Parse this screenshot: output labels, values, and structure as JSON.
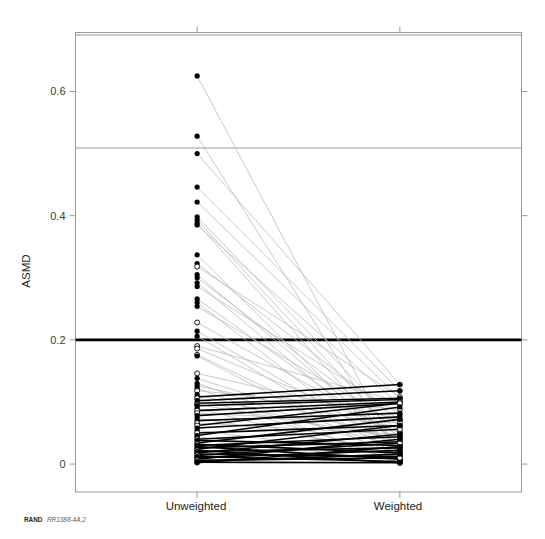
{
  "figure": {
    "width": 545,
    "height": 539,
    "background": "#ffffff",
    "credit_org": "RAND",
    "credit_id": "RR1388-4A.2"
  },
  "colors": {
    "frame": "#9a9a9a",
    "reference_light": "#9a9a9a",
    "reference_bold": "#000000",
    "link_gray": "#b8b8b8",
    "link_black": "#000000",
    "marker_fill": "#000000",
    "marker_open": "#ffffff",
    "text": "#231f20"
  },
  "chart_data": {
    "type": "line",
    "title": "",
    "subtitle": "",
    "xlabel": "",
    "ylabel": "ASMD",
    "categories": [
      "Unweighted",
      "Weighted"
    ],
    "x": [
      0,
      1
    ],
    "xlim": [
      -0.6,
      1.6
    ],
    "ylim": [
      -0.045,
      0.695
    ],
    "ytick_values": [
      0,
      0.2,
      0.4,
      0.6
    ],
    "ytick_labels": [
      "0",
      "0.2",
      "0.4",
      "0.6"
    ],
    "grid": false,
    "legend_position": "none",
    "annotations": [
      {
        "text": "RAND RR1388-4A.2",
        "position": "bottom-left",
        "kind": "source-credit"
      }
    ],
    "reference_lines": [
      {
        "y": 0.691,
        "style": "thin-gray",
        "note": "upper frame inner rule"
      },
      {
        "y": 0.509,
        "style": "thin-gray",
        "note": "mid rule"
      },
      {
        "y": 0.2,
        "style": "thick-black",
        "note": "ASMD balance threshold 0.2"
      }
    ],
    "marker_styles": {
      "filled": "solid black dot",
      "open": "hollow circle"
    },
    "series_note": "Each series is one covariate: ASMD before weighting (Unweighted) vs after weighting (Weighted). Thick black links denote pairs where ASMD changed little or increased; light gray links denote large reductions.",
    "series": [
      {
        "name": "cov-01",
        "values": [
          0.625,
          0.012
        ],
        "marker": "filled",
        "link": "gray"
      },
      {
        "name": "cov-02",
        "values": [
          0.528,
          0.01
        ],
        "marker": "filled",
        "link": "gray"
      },
      {
        "name": "cov-03",
        "values": [
          0.5,
          0.128
        ],
        "marker": "filled",
        "link": "gray"
      },
      {
        "name": "cov-04",
        "values": [
          0.446,
          0.118
        ],
        "marker": "filled",
        "link": "gray"
      },
      {
        "name": "cov-05",
        "values": [
          0.422,
          0.106
        ],
        "marker": "filled",
        "link": "gray"
      },
      {
        "name": "cov-06",
        "values": [
          0.398,
          0.06
        ],
        "marker": "filled",
        "link": "gray"
      },
      {
        "name": "cov-07",
        "values": [
          0.393,
          0.04
        ],
        "marker": "filled",
        "link": "gray"
      },
      {
        "name": "cov-08",
        "values": [
          0.388,
          0.022
        ],
        "marker": "filled",
        "link": "gray"
      },
      {
        "name": "cov-09",
        "values": [
          0.385,
          0.095
        ],
        "marker": "filled",
        "link": "gray"
      },
      {
        "name": "cov-10",
        "values": [
          0.337,
          0.015
        ],
        "marker": "filled",
        "link": "gray"
      },
      {
        "name": "cov-11",
        "values": [
          0.323,
          0.07
        ],
        "marker": "filled",
        "link": "gray"
      },
      {
        "name": "cov-12",
        "values": [
          0.318,
          0.108
        ],
        "marker": "open",
        "link": "gray"
      },
      {
        "name": "cov-13",
        "values": [
          0.305,
          0.03
        ],
        "marker": "filled",
        "link": "gray"
      },
      {
        "name": "cov-14",
        "values": [
          0.3,
          0.052
        ],
        "marker": "filled",
        "link": "gray"
      },
      {
        "name": "cov-15",
        "values": [
          0.292,
          0.018
        ],
        "marker": "filled",
        "link": "gray"
      },
      {
        "name": "cov-16",
        "values": [
          0.286,
          0.08
        ],
        "marker": "filled",
        "link": "gray"
      },
      {
        "name": "cov-17",
        "values": [
          0.266,
          0.035
        ],
        "marker": "filled",
        "link": "gray"
      },
      {
        "name": "cov-18",
        "values": [
          0.26,
          0.008
        ],
        "marker": "filled",
        "link": "gray"
      },
      {
        "name": "cov-19",
        "values": [
          0.254,
          0.062
        ],
        "marker": "filled",
        "link": "gray"
      },
      {
        "name": "cov-20",
        "values": [
          0.228,
          0.045
        ],
        "marker": "open",
        "link": "gray"
      },
      {
        "name": "cov-21",
        "values": [
          0.214,
          0.025
        ],
        "marker": "filled",
        "link": "gray"
      },
      {
        "name": "cov-22",
        "values": [
          0.206,
          0.012
        ],
        "marker": "filled",
        "link": "gray"
      },
      {
        "name": "cov-23",
        "values": [
          0.19,
          0.1
        ],
        "marker": "open",
        "link": "gray"
      },
      {
        "name": "cov-24",
        "values": [
          0.186,
          0.05
        ],
        "marker": "open",
        "link": "gray"
      },
      {
        "name": "cov-25",
        "values": [
          0.176,
          0.02
        ],
        "marker": "open",
        "link": "gray"
      },
      {
        "name": "cov-26",
        "values": [
          0.174,
          0.005
        ],
        "marker": "filled",
        "link": "gray"
      },
      {
        "name": "cov-27",
        "values": [
          0.146,
          0.072
        ],
        "marker": "open",
        "link": "gray"
      },
      {
        "name": "cov-28",
        "values": [
          0.138,
          0.034
        ],
        "marker": "filled",
        "link": "gray"
      },
      {
        "name": "cov-29",
        "values": [
          0.13,
          0.016
        ],
        "marker": "filled",
        "link": "gray"
      },
      {
        "name": "cov-30",
        "values": [
          0.126,
          0.058
        ],
        "marker": "filled",
        "link": "gray"
      },
      {
        "name": "cov-31",
        "values": [
          0.122,
          0.002
        ],
        "marker": "filled",
        "link": "gray"
      },
      {
        "name": "cov-32",
        "values": [
          0.118,
          0.088
        ],
        "marker": "open",
        "link": "gray"
      },
      {
        "name": "cov-33",
        "values": [
          0.112,
          0.028
        ],
        "marker": "filled",
        "link": "gray"
      },
      {
        "name": "cov-34",
        "values": [
          0.108,
          0.128
        ],
        "marker": "filled",
        "link": "black"
      },
      {
        "name": "cov-35",
        "values": [
          0.106,
          0.01
        ],
        "marker": "open",
        "link": "gray"
      },
      {
        "name": "cov-36",
        "values": [
          0.102,
          0.118
        ],
        "marker": "filled",
        "link": "black"
      },
      {
        "name": "cov-37",
        "values": [
          0.098,
          0.106
        ],
        "marker": "filled",
        "link": "black"
      },
      {
        "name": "cov-38",
        "values": [
          0.096,
          0.042
        ],
        "marker": "open",
        "link": "gray"
      },
      {
        "name": "cov-39",
        "values": [
          0.094,
          0.104
        ],
        "marker": "filled",
        "link": "black"
      },
      {
        "name": "cov-40",
        "values": [
          0.09,
          0.006
        ],
        "marker": "filled",
        "link": "gray"
      },
      {
        "name": "cov-41",
        "values": [
          0.086,
          0.1
        ],
        "marker": "open",
        "link": "black"
      },
      {
        "name": "cov-42",
        "values": [
          0.082,
          0.066
        ],
        "marker": "open",
        "link": "gray"
      },
      {
        "name": "cov-43",
        "values": [
          0.078,
          0.098
        ],
        "marker": "filled",
        "link": "black"
      },
      {
        "name": "cov-44",
        "values": [
          0.074,
          0.02
        ],
        "marker": "filled",
        "link": "gray"
      },
      {
        "name": "cov-45",
        "values": [
          0.07,
          0.082
        ],
        "marker": "filled",
        "link": "black"
      },
      {
        "name": "cov-46",
        "values": [
          0.066,
          0.048
        ],
        "marker": "open",
        "link": "gray"
      },
      {
        "name": "cov-47",
        "values": [
          0.062,
          0.098
        ],
        "marker": "open",
        "link": "black"
      },
      {
        "name": "cov-48",
        "values": [
          0.058,
          0.076
        ],
        "marker": "filled",
        "link": "black"
      },
      {
        "name": "cov-49",
        "values": [
          0.054,
          0.014
        ],
        "marker": "filled",
        "link": "gray"
      },
      {
        "name": "cov-50",
        "values": [
          0.05,
          0.062
        ],
        "marker": "open",
        "link": "black"
      },
      {
        "name": "cov-51",
        "values": [
          0.046,
          0.092
        ],
        "marker": "filled",
        "link": "black"
      },
      {
        "name": "cov-52",
        "values": [
          0.044,
          0.004
        ],
        "marker": "filled",
        "link": "gray"
      },
      {
        "name": "cov-53",
        "values": [
          0.04,
          0.056
        ],
        "marker": "open",
        "link": "black"
      },
      {
        "name": "cov-54",
        "values": [
          0.038,
          0.03
        ],
        "marker": "filled",
        "link": "black"
      },
      {
        "name": "cov-55",
        "values": [
          0.034,
          0.072
        ],
        "marker": "filled",
        "link": "black"
      },
      {
        "name": "cov-56",
        "values": [
          0.032,
          0.018
        ],
        "marker": "open",
        "link": "black"
      },
      {
        "name": "cov-57",
        "values": [
          0.03,
          0.044
        ],
        "marker": "filled",
        "link": "black"
      },
      {
        "name": "cov-58",
        "values": [
          0.028,
          0.008
        ],
        "marker": "filled",
        "link": "black"
      },
      {
        "name": "cov-59",
        "values": [
          0.026,
          0.036
        ],
        "marker": "filled",
        "link": "black"
      },
      {
        "name": "cov-60",
        "values": [
          0.024,
          0.062
        ],
        "marker": "filled",
        "link": "black"
      },
      {
        "name": "cov-61",
        "values": [
          0.022,
          0.002
        ],
        "marker": "open",
        "link": "black"
      },
      {
        "name": "cov-62",
        "values": [
          0.02,
          0.026
        ],
        "marker": "filled",
        "link": "black"
      },
      {
        "name": "cov-63",
        "values": [
          0.018,
          0.048
        ],
        "marker": "filled",
        "link": "black"
      },
      {
        "name": "cov-64",
        "values": [
          0.016,
          0.012
        ],
        "marker": "filled",
        "link": "black"
      },
      {
        "name": "cov-65",
        "values": [
          0.014,
          0.034
        ],
        "marker": "open",
        "link": "black"
      },
      {
        "name": "cov-66",
        "values": [
          0.012,
          0.004
        ],
        "marker": "filled",
        "link": "black"
      },
      {
        "name": "cov-67",
        "values": [
          0.01,
          0.022
        ],
        "marker": "filled",
        "link": "black"
      },
      {
        "name": "cov-68",
        "values": [
          0.008,
          0.04
        ],
        "marker": "filled",
        "link": "black"
      },
      {
        "name": "cov-69",
        "values": [
          0.006,
          0.01
        ],
        "marker": "open",
        "link": "black"
      },
      {
        "name": "cov-70",
        "values": [
          0.004,
          0.016
        ],
        "marker": "filled",
        "link": "black"
      },
      {
        "name": "cov-71",
        "values": [
          0.003,
          0.002
        ],
        "marker": "filled",
        "link": "black"
      },
      {
        "name": "cov-72",
        "values": [
          0.002,
          0.028
        ],
        "marker": "filled",
        "link": "black"
      }
    ]
  }
}
